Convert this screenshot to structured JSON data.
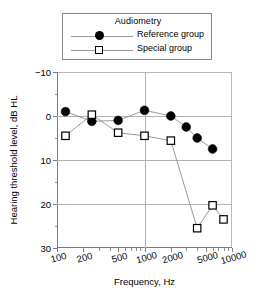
{
  "legend": {
    "title": "Audiometry",
    "entries": [
      {
        "label": "Reference group",
        "marker": "filled-circle",
        "color": "#000000"
      },
      {
        "label": "Special group",
        "marker": "open-square",
        "color": "#000000"
      }
    ]
  },
  "axes": {
    "x_title": "Frequency, Hz",
    "y_title": "Hearing threshold level, dB HL",
    "x_ticks": [
      "100",
      "200",
      "500",
      "1000",
      "2000",
      "5000",
      "10000"
    ],
    "y_ticks": [
      "−10",
      "0",
      "10",
      "20",
      "30"
    ]
  },
  "chart_data": {
    "type": "line",
    "title": "Audiometry",
    "xlabel": "Frequency, Hz",
    "ylabel": "Hearing threshold level, dB HL",
    "xscale": "log",
    "xlim": [
      100,
      10000
    ],
    "ylim": [
      -10,
      30
    ],
    "y_inverted": true,
    "grid": true,
    "legend_position": "top-center",
    "x_tick_values": [
      100,
      200,
      500,
      1000,
      2000,
      5000,
      10000
    ],
    "x_tick_labels": [
      "100",
      "200",
      "500",
      "1000",
      "2000",
      "5000",
      "10000"
    ],
    "y_tick_values": [
      -10,
      0,
      10,
      20,
      30
    ],
    "y_tick_labels": [
      "−10",
      "0",
      "10",
      "20",
      "30"
    ],
    "series": [
      {
        "name": "Reference group",
        "marker": "filled-circle",
        "color": "#000000",
        "points": [
          {
            "x": 125,
            "y": -1.0
          },
          {
            "x": 250,
            "y": 1.2
          },
          {
            "x": 500,
            "y": 1.0
          },
          {
            "x": 1000,
            "y": -1.3
          },
          {
            "x": 2000,
            "y": 0.0
          },
          {
            "x": 3000,
            "y": 2.5
          },
          {
            "x": 4000,
            "y": 5.0
          },
          {
            "x": 6000,
            "y": 7.5
          }
        ]
      },
      {
        "name": "Special group",
        "marker": "open-square",
        "color": "#000000",
        "points": [
          {
            "x": 125,
            "y": 4.5
          },
          {
            "x": 250,
            "y": -0.3
          },
          {
            "x": 500,
            "y": 3.8
          },
          {
            "x": 1000,
            "y": 4.5
          },
          {
            "x": 2000,
            "y": 5.6
          },
          {
            "x": 4000,
            "y": 25.5
          },
          {
            "x": 6000,
            "y": 20.3
          },
          {
            "x": 8000,
            "y": 23.5
          }
        ]
      }
    ]
  }
}
